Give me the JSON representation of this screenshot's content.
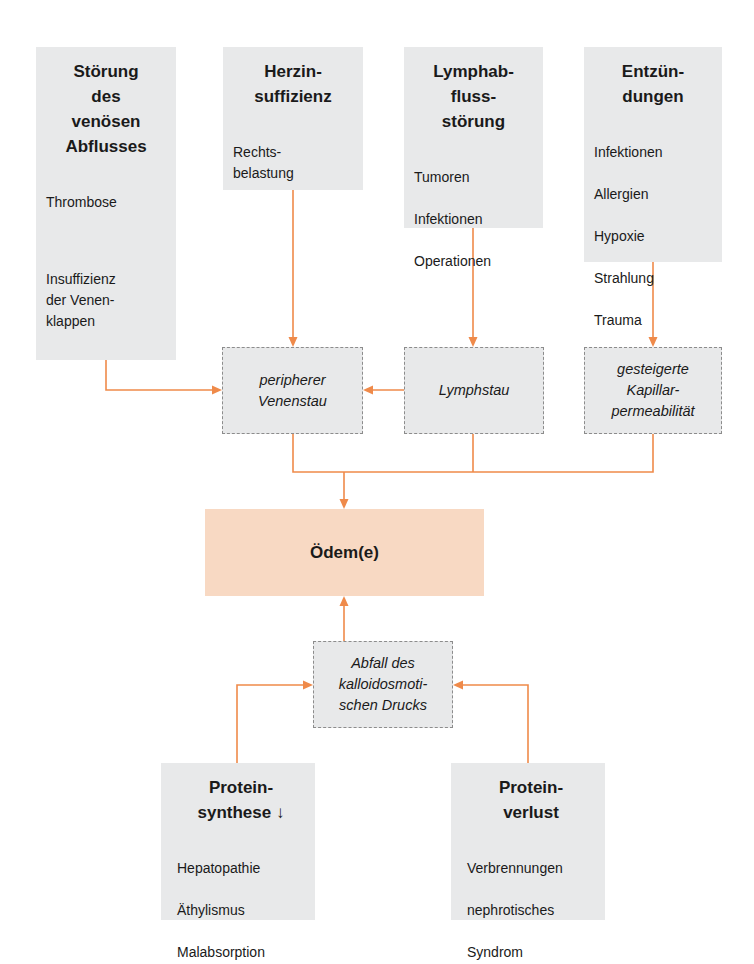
{
  "diagram": {
    "accent_color": "#ef8a4a",
    "cause_box_color": "#e8e9ea",
    "result_box_color": "#f8d9c3",
    "causes_top": [
      {
        "id": "venous",
        "title": "Störung\ndes\nvenösen\nAbflusses",
        "items": [
          "Thrombose",
          "",
          "Insuffizienz\nder Venen-\nklappen"
        ]
      },
      {
        "id": "heart",
        "title": "Herzin-\nsuffizienz",
        "items": [
          "Rechts-\nbelastung"
        ]
      },
      {
        "id": "lymph",
        "title": "Lymphab-\nfluss-\nstörung",
        "items": [
          "Tumoren",
          "Infektionen",
          "Operationen"
        ]
      },
      {
        "id": "inflam",
        "title": "Entzün-\ndungen",
        "items": [
          "Infektionen",
          "Allergien",
          "Hypoxie",
          "Strahlung",
          "Trauma"
        ]
      }
    ],
    "mechanisms": [
      {
        "id": "venenstau",
        "label": "peripherer\nVenenstau"
      },
      {
        "id": "lymphstau",
        "label": "Lymphstau"
      },
      {
        "id": "kapillar",
        "label": "gesteigerte\nKapillar-\npermeabilität"
      },
      {
        "id": "onkotisch",
        "label": "Abfall des\nkalloidosmoti-\nschen Drucks"
      }
    ],
    "result": {
      "label": "Ödem(e)"
    },
    "causes_bottom": [
      {
        "id": "synthese",
        "title": "Protein-\nsynthese ↓",
        "items": [
          "Hepatopathie",
          "Äthylismus",
          "Malabsorption"
        ]
      },
      {
        "id": "verlust",
        "title": "Protein-\nverlust",
        "items": [
          "Verbrennungen",
          "nephrotisches",
          "Syndrom"
        ]
      }
    ],
    "edges": [
      {
        "from": "venous",
        "to": "venenstau"
      },
      {
        "from": "heart",
        "to": "venenstau"
      },
      {
        "from": "lymph",
        "to": "lymphstau"
      },
      {
        "from": "lymphstau",
        "to": "venenstau"
      },
      {
        "from": "inflam",
        "to": "kapillar"
      },
      {
        "from": "venenstau",
        "to": "result"
      },
      {
        "from": "lymphstau",
        "to": "result"
      },
      {
        "from": "kapillar",
        "to": "result"
      },
      {
        "from": "onkotisch",
        "to": "result"
      },
      {
        "from": "synthese",
        "to": "onkotisch"
      },
      {
        "from": "verlust",
        "to": "onkotisch"
      }
    ]
  }
}
